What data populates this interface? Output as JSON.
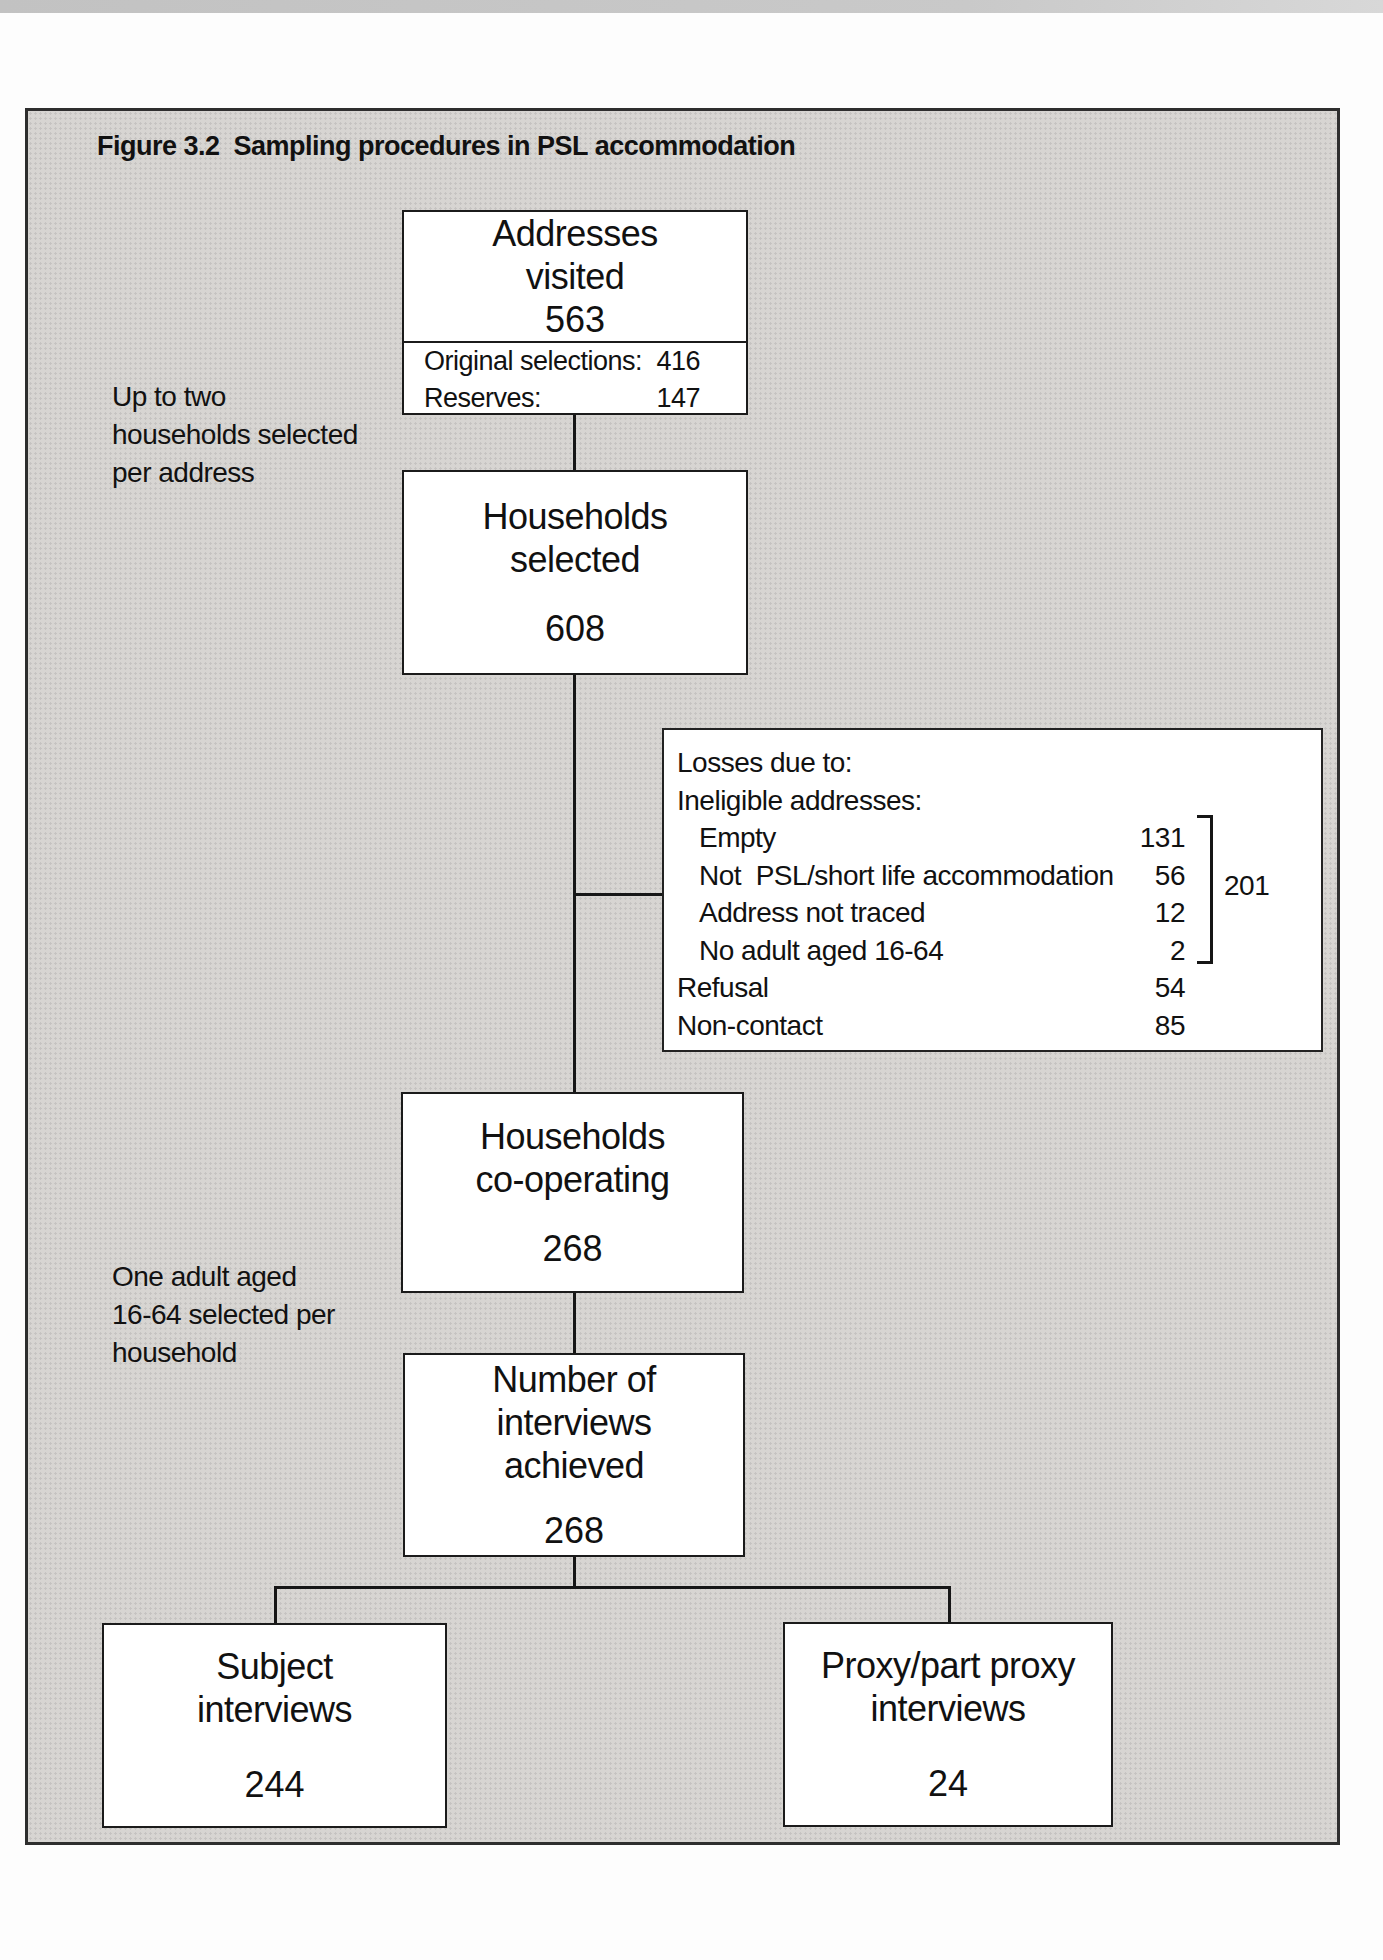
{
  "figure": {
    "title": "Figure 3.2  Sampling procedures in PSL accommodation"
  },
  "style": {
    "ink": "#111111",
    "panel_gray": "#d7d5d2"
  },
  "boxes": {
    "addresses_visited": {
      "title_lines": [
        "Addresses",
        "visited"
      ],
      "value": "563",
      "breakdown": [
        {
          "label": "Original selections:",
          "value": "416"
        },
        {
          "label": "Reserves:",
          "value": "147"
        }
      ]
    },
    "households_selected": {
      "title_lines": [
        "Households",
        "selected"
      ],
      "value": "608"
    },
    "households_cooperating": {
      "title_lines": [
        "Households",
        "co-operating"
      ],
      "value": "268"
    },
    "interviews_achieved": {
      "title_lines": [
        "Number of",
        "interviews",
        "achieved"
      ],
      "value": "268"
    },
    "subject_interviews": {
      "title_lines": [
        "Subject",
        "interviews"
      ],
      "value": "244"
    },
    "proxy_interviews": {
      "title_lines": [
        "Proxy/part proxy",
        "interviews"
      ],
      "value": "24"
    }
  },
  "annotations": {
    "note1_lines": [
      "Up to two",
      "households selected",
      "per address"
    ],
    "note2_lines": [
      "One adult aged",
      "16-64 selected per",
      "household"
    ]
  },
  "losses": {
    "heading": "Losses due to:",
    "subheading": "Ineligible addresses:",
    "items": [
      {
        "label": "Empty",
        "value": "131"
      },
      {
        "label": "Not  PSL/short life accommodation",
        "value": "56"
      },
      {
        "label": "Address not traced",
        "value": "12"
      },
      {
        "label": "No adult aged 16-64",
        "value": "2"
      },
      {
        "label": "Refusal",
        "value": "54"
      },
      {
        "label": "Non-contact",
        "value": "85"
      }
    ],
    "bracket_total": "201"
  }
}
